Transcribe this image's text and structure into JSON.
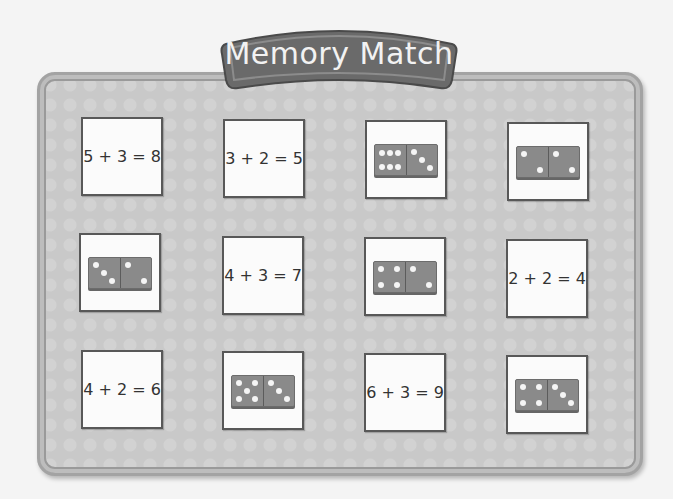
{
  "title": "Memory Match",
  "colors": {
    "board": "#c9c9c9",
    "banner": "#6a6a6a",
    "card_bg": "#fbfbfb",
    "card_border": "#585858",
    "domino": "#8a8a8a",
    "pip": "#f5f5f5"
  },
  "cards": [
    {
      "type": "equation",
      "text": "5 + 3 = 8",
      "row": 1,
      "col": 1
    },
    {
      "type": "equation",
      "text": "3 + 2 = 5",
      "row": 1,
      "col": 2
    },
    {
      "type": "domino",
      "left": 6,
      "right": 3,
      "row": 1,
      "col": 3
    },
    {
      "type": "domino",
      "left": 2,
      "right": 2,
      "row": 1,
      "col": 4
    },
    {
      "type": "domino",
      "left": 3,
      "right": 2,
      "row": 2,
      "col": 1
    },
    {
      "type": "equation",
      "text": "4 + 3 = 7",
      "row": 2,
      "col": 2
    },
    {
      "type": "domino",
      "left": 4,
      "right": 2,
      "row": 2,
      "col": 3
    },
    {
      "type": "equation",
      "text": "2 + 2 = 4",
      "row": 2,
      "col": 4
    },
    {
      "type": "equation",
      "text": "4 + 2 = 6",
      "row": 3,
      "col": 1
    },
    {
      "type": "domino",
      "left": 5,
      "right": 3,
      "row": 3,
      "col": 2
    },
    {
      "type": "equation",
      "text": "6 + 3 = 9",
      "row": 3,
      "col": 3
    },
    {
      "type": "domino",
      "left": 4,
      "right": 3,
      "row": 3,
      "col": 4
    }
  ]
}
